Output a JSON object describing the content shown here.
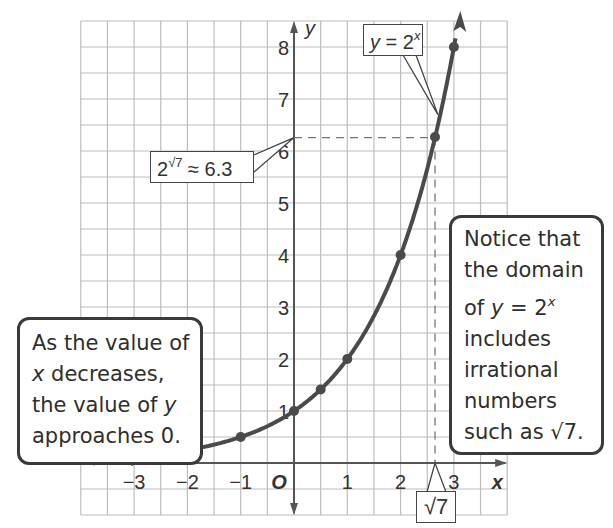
{
  "chart_data": {
    "type": "line",
    "title": "",
    "function": "y = 2^x",
    "xlabel": "x",
    "ylabel": "y",
    "origin_label": "O",
    "xlim": [
      -4,
      4
    ],
    "ylim": [
      -1,
      8.5
    ],
    "grid": true,
    "grid_step": 0.5,
    "x_ticks": [
      -3,
      -2,
      -1,
      1,
      2,
      3
    ],
    "x_tick_labels": [
      "−3",
      "−2",
      "−1",
      "1",
      "2",
      "3"
    ],
    "y_ticks": [
      1,
      2,
      3,
      4,
      5,
      6,
      7,
      8
    ],
    "y_tick_labels": [
      "1",
      "2",
      "3",
      "4",
      "5",
      "6",
      "7",
      "8"
    ],
    "series": [
      {
        "name": "y = 2^x",
        "points": [
          {
            "x": -3,
            "y": 0.125
          },
          {
            "x": -2,
            "y": 0.25
          },
          {
            "x": -1,
            "y": 0.5
          },
          {
            "x": 0,
            "y": 1
          },
          {
            "x": 0.5,
            "y": 1.414
          },
          {
            "x": 1,
            "y": 2
          },
          {
            "x": 2,
            "y": 4
          },
          {
            "x": 2.6458,
            "y": 6.27
          },
          {
            "x": 3,
            "y": 8
          }
        ]
      }
    ],
    "annotations": [
      {
        "id": "function-label",
        "text": "y = 2^x"
      },
      {
        "id": "sqrt7-value",
        "text": "2^√7 ≈ 6.3",
        "x": 0,
        "y": 6.27
      },
      {
        "id": "sqrt7-x",
        "text": "√7",
        "x": 2.6458,
        "y": 0
      },
      {
        "id": "left-note",
        "text": "As the value of x decreases, the value of y approaches 0."
      },
      {
        "id": "right-note",
        "text": "Notice that the domain of y = 2^x includes irrational numbers such as √7."
      }
    ],
    "colors": {
      "curve": "#4a4a4a",
      "axes": "#555555",
      "grid": "#bdbdbd",
      "dashed": "#777777",
      "callout_border": "#3a3a3a"
    }
  },
  "labels": {
    "func_y": "y",
    "func_eq": " = 2",
    "func_exp": "x",
    "sqrt_base": "2",
    "sqrt_exp": "√7",
    "sqrt_value": " ≈ 6.3",
    "sqrt7": "√7",
    "left_lines": [
      "As the value of",
      " decreases,",
      "the value of ",
      "approaches 0."
    ],
    "left_x": "x",
    "left_y": "y",
    "right_lines": [
      "Notice that",
      "the domain",
      "of ",
      " = 2",
      "includes",
      "irrational",
      "numbers",
      "such as √7."
    ],
    "right_y": "y",
    "right_exp": "x"
  }
}
